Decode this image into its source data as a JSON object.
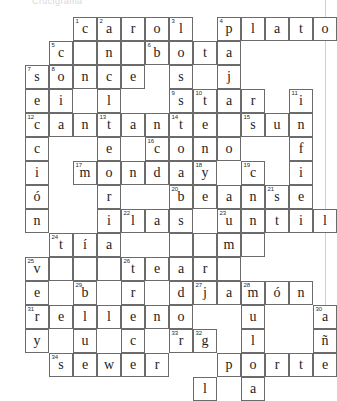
{
  "page": {
    "header_fragment": "Crucigrama",
    "type": "crossword-puzzle",
    "columns": 13,
    "rows": 13,
    "cell_size": 24,
    "grid_origin_x": 25,
    "grid_origin_y": 17,
    "ink_color": "#1c1c1c",
    "grid_line_color": "#6b6b6b",
    "background_color": "#ffffff"
  },
  "crossword": {
    "cells": [
      {
        "c": 2,
        "r": 0,
        "n": "1",
        "l": "c"
      },
      {
        "c": 3,
        "r": 0,
        "n": "2",
        "l": "a"
      },
      {
        "c": 4,
        "r": 0,
        "n": "",
        "l": "r"
      },
      {
        "c": 5,
        "r": 0,
        "n": "",
        "l": "o"
      },
      {
        "c": 6,
        "r": 0,
        "n": "3",
        "l": "l"
      },
      {
        "c": 8,
        "r": 0,
        "n": "4",
        "l": "p"
      },
      {
        "c": 9,
        "r": 0,
        "n": "",
        "l": "l"
      },
      {
        "c": 10,
        "r": 0,
        "n": "",
        "l": "a"
      },
      {
        "c": 11,
        "r": 0,
        "n": "",
        "l": "t"
      },
      {
        "c": 12,
        "r": 0,
        "n": "",
        "l": "o"
      },
      {
        "c": 1,
        "r": 1,
        "n": "5",
        "l": "c"
      },
      {
        "c": 2,
        "r": 1,
        "n": "",
        "l": ""
      },
      {
        "c": 3,
        "r": 1,
        "n": "",
        "l": "n"
      },
      {
        "c": 4,
        "r": 1,
        "n": "",
        "l": ""
      },
      {
        "c": 5,
        "r": 1,
        "n": "6",
        "l": "b"
      },
      {
        "c": 6,
        "r": 1,
        "n": "",
        "l": "o"
      },
      {
        "c": 7,
        "r": 1,
        "n": "",
        "l": "t"
      },
      {
        "c": 8,
        "r": 1,
        "n": "",
        "l": "a"
      },
      {
        "c": 0,
        "r": 2,
        "n": "7",
        "l": "s"
      },
      {
        "c": 1,
        "r": 2,
        "n": "8",
        "l": "o"
      },
      {
        "c": 2,
        "r": 2,
        "n": "",
        "l": "n"
      },
      {
        "c": 3,
        "r": 2,
        "n": "",
        "l": "c"
      },
      {
        "c": 4,
        "r": 2,
        "n": "",
        "l": "e"
      },
      {
        "c": 6,
        "r": 2,
        "n": "",
        "l": "s"
      },
      {
        "c": 8,
        "r": 2,
        "n": "",
        "l": "j"
      },
      {
        "c": 0,
        "r": 3,
        "n": "",
        "l": "e"
      },
      {
        "c": 1,
        "r": 3,
        "n": "",
        "l": "i"
      },
      {
        "c": 3,
        "r": 3,
        "n": "",
        "l": "l"
      },
      {
        "c": 6,
        "r": 3,
        "n": "9",
        "l": "s"
      },
      {
        "c": 7,
        "r": 3,
        "n": "10",
        "l": "t"
      },
      {
        "c": 8,
        "r": 3,
        "n": "",
        "l": "a"
      },
      {
        "c": 9,
        "r": 3,
        "n": "",
        "l": "r"
      },
      {
        "c": 11,
        "r": 3,
        "n": "11",
        "l": "i"
      },
      {
        "c": 0,
        "r": 4,
        "n": "12",
        "l": "c"
      },
      {
        "c": 1,
        "r": 4,
        "n": "",
        "l": "a"
      },
      {
        "c": 2,
        "r": 4,
        "n": "",
        "l": "n"
      },
      {
        "c": 3,
        "r": 4,
        "n": "13",
        "l": "t"
      },
      {
        "c": 4,
        "r": 4,
        "n": "",
        "l": "a"
      },
      {
        "c": 5,
        "r": 4,
        "n": "",
        "l": "n"
      },
      {
        "c": 6,
        "r": 4,
        "n": "14",
        "l": "t"
      },
      {
        "c": 7,
        "r": 4,
        "n": "",
        "l": "e"
      },
      {
        "c": 8,
        "r": 4,
        "n": "",
        "l": ""
      },
      {
        "c": 9,
        "r": 4,
        "n": "15",
        "l": "s"
      },
      {
        "c": 10,
        "r": 4,
        "n": "",
        "l": "u"
      },
      {
        "c": 11,
        "r": 4,
        "n": "",
        "l": "n"
      },
      {
        "c": 0,
        "r": 5,
        "n": "",
        "l": "c"
      },
      {
        "c": 3,
        "r": 5,
        "n": "",
        "l": "e"
      },
      {
        "c": 5,
        "r": 5,
        "n": "16",
        "l": "c"
      },
      {
        "c": 6,
        "r": 5,
        "n": "",
        "l": "o"
      },
      {
        "c": 7,
        "r": 5,
        "n": "",
        "l": "n"
      },
      {
        "c": 8,
        "r": 5,
        "n": "",
        "l": "o"
      },
      {
        "c": 11,
        "r": 5,
        "n": "",
        "l": "f"
      },
      {
        "c": 0,
        "r": 6,
        "n": "",
        "l": "i"
      },
      {
        "c": 2,
        "r": 6,
        "n": "17",
        "l": "m"
      },
      {
        "c": 3,
        "r": 6,
        "n": "",
        "l": "o"
      },
      {
        "c": 4,
        "r": 6,
        "n": "",
        "l": "n"
      },
      {
        "c": 5,
        "r": 6,
        "n": "",
        "l": "d"
      },
      {
        "c": 6,
        "r": 6,
        "n": "",
        "l": "a"
      },
      {
        "c": 7,
        "r": 6,
        "n": "18",
        "l": "y"
      },
      {
        "c": 9,
        "r": 6,
        "n": "19",
        "l": "c"
      },
      {
        "c": 11,
        "r": 6,
        "n": "",
        "l": "i"
      },
      {
        "c": 0,
        "r": 7,
        "n": "",
        "l": "ó"
      },
      {
        "c": 3,
        "r": 7,
        "n": "",
        "l": "r"
      },
      {
        "c": 6,
        "r": 7,
        "n": "20",
        "l": "b"
      },
      {
        "c": 7,
        "r": 7,
        "n": "",
        "l": "e"
      },
      {
        "c": 8,
        "r": 7,
        "n": "",
        "l": "a"
      },
      {
        "c": 9,
        "r": 7,
        "n": "",
        "l": "n"
      },
      {
        "c": 10,
        "r": 7,
        "n": "21",
        "l": "s"
      },
      {
        "c": 11,
        "r": 7,
        "n": "",
        "l": "e"
      },
      {
        "c": 0,
        "r": 8,
        "n": "",
        "l": "n"
      },
      {
        "c": 3,
        "r": 8,
        "n": "",
        "l": "i"
      },
      {
        "c": 4,
        "r": 8,
        "n": "22",
        "l": "l"
      },
      {
        "c": 5,
        "r": 8,
        "n": "",
        "l": "a"
      },
      {
        "c": 6,
        "r": 8,
        "n": "",
        "l": "s"
      },
      {
        "c": 8,
        "r": 8,
        "n": "23",
        "l": "u"
      },
      {
        "c": 9,
        "r": 8,
        "n": "",
        "l": "n"
      },
      {
        "c": 10,
        "r": 8,
        "n": "",
        "l": "t"
      },
      {
        "c": 11,
        "r": 8,
        "n": "",
        "l": "i"
      },
      {
        "c": 12,
        "r": 8,
        "n": "",
        "l": "l"
      },
      {
        "c": 1,
        "r": 9,
        "n": "24",
        "l": "t"
      },
      {
        "c": 2,
        "r": 9,
        "n": "",
        "l": "í"
      },
      {
        "c": 3,
        "r": 9,
        "n": "",
        "l": "a"
      },
      {
        "c": 8,
        "r": 9,
        "n": "",
        "l": "m"
      },
      {
        "c": 0,
        "r": 10,
        "n": "25",
        "l": "v"
      },
      {
        "c": 1,
        "r": 10,
        "n": "",
        "l": ""
      },
      {
        "c": 2,
        "r": 10,
        "n": "",
        "l": ""
      },
      {
        "c": 3,
        "r": 10,
        "n": "",
        "l": ""
      },
      {
        "c": 4,
        "r": 10,
        "n": "26",
        "l": "t"
      },
      {
        "c": 5,
        "r": 10,
        "n": "",
        "l": "e"
      },
      {
        "c": 6,
        "r": 10,
        "n": "",
        "l": "a"
      },
      {
        "c": 7,
        "r": 10,
        "n": "",
        "l": "r"
      },
      {
        "c": 8,
        "r": 10,
        "n": "",
        "l": ""
      },
      {
        "c": 0,
        "r": 11,
        "n": "",
        "l": "e"
      },
      {
        "c": 2,
        "r": 11,
        "n": "29",
        "l": "b"
      },
      {
        "c": 4,
        "r": 11,
        "n": "",
        "l": "r"
      },
      {
        "c": 6,
        "r": 11,
        "n": "",
        "l": "d"
      },
      {
        "c": 0,
        "r": 12,
        "n": "31",
        "l": "r"
      },
      {
        "c": 1,
        "r": 12,
        "n": "",
        "l": "e"
      },
      {
        "c": 2,
        "r": 12,
        "n": "",
        "l": "l"
      },
      {
        "c": 3,
        "r": 12,
        "n": "",
        "l": "l"
      },
      {
        "c": 4,
        "r": 12,
        "n": "",
        "l": "e"
      },
      {
        "c": 5,
        "r": 12,
        "n": "",
        "l": "n"
      },
      {
        "c": 6,
        "r": 12,
        "n": "",
        "l": "o"
      },
      {
        "c": 0,
        "r": 13,
        "n": "",
        "l": "y"
      },
      {
        "c": 2,
        "r": 13,
        "n": "",
        "l": "u"
      },
      {
        "c": 4,
        "r": 13,
        "n": "",
        "l": "c"
      },
      {
        "c": 6,
        "r": 13,
        "n": "33",
        "l": "r"
      },
      {
        "c": 7,
        "r": 13,
        "n": "",
        "l": "e"
      },
      {
        "c": 1,
        "r": 14,
        "n": "34",
        "l": "s"
      },
      {
        "c": 2,
        "r": 14,
        "n": "",
        "l": "e"
      },
      {
        "c": 3,
        "r": 14,
        "n": "",
        "l": "w"
      },
      {
        "c": 4,
        "r": 14,
        "n": "",
        "l": "e"
      },
      {
        "c": 5,
        "r": 14,
        "n": "",
        "l": "r"
      },
      {
        "c": 9,
        "r": 9,
        "n": "",
        "l": ""
      },
      {
        "c": 6,
        "r": 9,
        "n": "",
        "l": ""
      },
      {
        "c": 7,
        "r": 9,
        "n": "",
        "l": ""
      },
      {
        "c": 7,
        "r": 11,
        "n": "27",
        "l": "j"
      },
      {
        "c": 8,
        "r": 11,
        "n": "",
        "l": "a"
      },
      {
        "c": 9,
        "r": 11,
        "n": "28",
        "l": "m"
      },
      {
        "c": 10,
        "r": 11,
        "n": "",
        "l": "ó"
      },
      {
        "c": 11,
        "r": 11,
        "n": "",
        "l": "n"
      },
      {
        "c": 9,
        "r": 12,
        "n": "",
        "l": "u"
      },
      {
        "c": 12,
        "r": 12,
        "n": "30",
        "l": "a"
      },
      {
        "c": 7,
        "r": 13,
        "n": "32",
        "l": "g"
      },
      {
        "c": 9,
        "r": 13,
        "n": "",
        "l": "l"
      },
      {
        "c": 12,
        "r": 13,
        "n": "",
        "l": "ñ"
      },
      {
        "c": 8,
        "r": 14,
        "n": "",
        "l": "p"
      },
      {
        "c": 9,
        "r": 14,
        "n": "",
        "l": "o"
      },
      {
        "c": 10,
        "r": 14,
        "n": "",
        "l": "r"
      },
      {
        "c": 11,
        "r": 14,
        "n": "",
        "l": "t"
      },
      {
        "c": 12,
        "r": 14,
        "n": "",
        "l": "e"
      },
      {
        "c": 7,
        "r": 15,
        "n": "",
        "l": "l"
      },
      {
        "c": 9,
        "r": 15,
        "n": "",
        "l": "a"
      }
    ]
  }
}
